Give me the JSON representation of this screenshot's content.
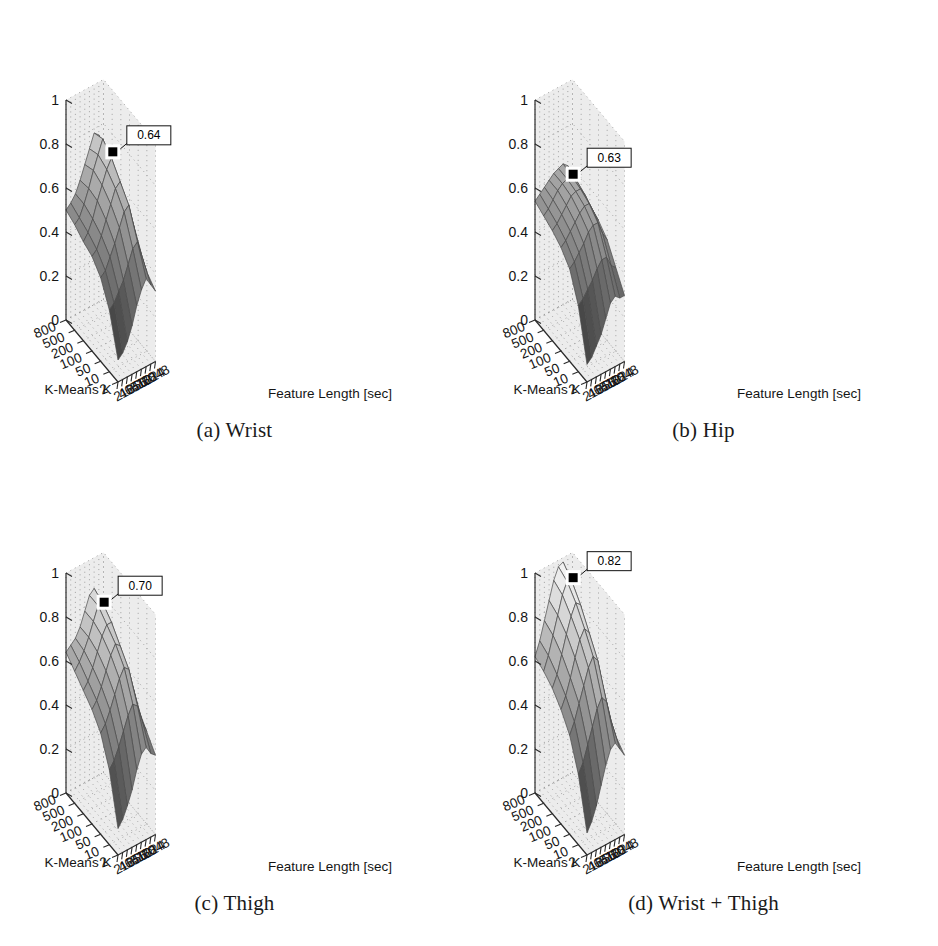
{
  "figure": {
    "background_color": "#ffffff",
    "panel_count": 4,
    "layout": "2x2"
  },
  "axes": {
    "z_ticks": [
      "0",
      "0.2",
      "0.4",
      "0.6",
      "0.8",
      "1"
    ],
    "z_values": [
      0,
      0.2,
      0.4,
      0.6,
      0.8,
      1
    ],
    "x_name": "K-Means K",
    "x_ticks": [
      "800",
      "500",
      "200",
      "100",
      "50",
      "10",
      "2"
    ],
    "x_values": [
      800,
      500,
      200,
      100,
      50,
      10,
      2
    ],
    "y_name": "Feature Length [sec]",
    "y_ticks": [
      "2",
      "4",
      "16",
      "64",
      "256",
      "512",
      "768",
      "1024",
      "2048"
    ],
    "y_values": [
      2,
      4,
      16,
      64,
      256,
      512,
      768,
      1024,
      2048
    ]
  },
  "colors": {
    "wall": "#ececec",
    "grid_dot": "#9a9a9a",
    "axis_line": "#2a2a2a",
    "mesh_edge": "#4a4a4a",
    "marker": "#000000",
    "label_box": "#ffffff",
    "text": "#151515"
  },
  "panels": [
    {
      "id": "a",
      "caption": "(a) Wrist",
      "peak_label": "0.64",
      "peak_value": 0.64
    },
    {
      "id": "b",
      "caption": "(b) Hip",
      "peak_label": "0.63",
      "peak_value": 0.63
    },
    {
      "id": "c",
      "caption": "(c) Thigh",
      "peak_label": "0.70",
      "peak_value": 0.7
    },
    {
      "id": "d",
      "caption": "(d) Wrist + Thigh",
      "peak_label": "0.82",
      "peak_value": 0.82
    }
  ],
  "chart_data": [
    {
      "type": "heatmap",
      "title": "(a) Wrist",
      "render": "3d-surface",
      "xlabel": "K-Means K",
      "ylabel": "Feature Length [sec]",
      "zlabel": "",
      "x": [
        800,
        500,
        200,
        100,
        50,
        10,
        2
      ],
      "y": [
        2,
        4,
        16,
        64,
        256,
        512,
        768,
        1024,
        2048
      ],
      "zlim": [
        0,
        1
      ],
      "grid": true,
      "legend": "none",
      "annotations": [
        {
          "text": "0.64",
          "value": 0.64,
          "marker": "black-square"
        }
      ],
      "values": [
        [
          0.5,
          0.52,
          0.55,
          0.6,
          0.66,
          0.72,
          0.78,
          0.76,
          0.6
        ],
        [
          0.48,
          0.5,
          0.55,
          0.61,
          0.68,
          0.74,
          0.8,
          0.72,
          0.55
        ],
        [
          0.45,
          0.48,
          0.53,
          0.6,
          0.66,
          0.72,
          0.76,
          0.66,
          0.5
        ],
        [
          0.43,
          0.45,
          0.5,
          0.56,
          0.62,
          0.68,
          0.7,
          0.6,
          0.46
        ],
        [
          0.38,
          0.4,
          0.45,
          0.5,
          0.56,
          0.62,
          0.64,
          0.54,
          0.42
        ],
        [
          0.28,
          0.3,
          0.34,
          0.38,
          0.44,
          0.5,
          0.52,
          0.44,
          0.36
        ],
        [
          0.1,
          0.12,
          0.16,
          0.22,
          0.3,
          0.36,
          0.4,
          0.36,
          0.32
        ]
      ]
    },
    {
      "type": "heatmap",
      "title": "(b) Hip",
      "render": "3d-surface",
      "xlabel": "K-Means K",
      "ylabel": "Feature Length [sec]",
      "zlabel": "",
      "x": [
        800,
        500,
        200,
        100,
        50,
        10,
        2
      ],
      "y": [
        2,
        4,
        16,
        64,
        256,
        512,
        768,
        1024,
        2048
      ],
      "zlim": [
        0,
        1
      ],
      "grid": true,
      "legend": "none",
      "annotations": [
        {
          "text": "0.63",
          "value": 0.63,
          "marker": "black-square"
        }
      ],
      "values": [
        [
          0.54,
          0.56,
          0.58,
          0.6,
          0.62,
          0.63,
          0.64,
          0.62,
          0.56
        ],
        [
          0.52,
          0.54,
          0.57,
          0.6,
          0.62,
          0.63,
          0.63,
          0.6,
          0.54
        ],
        [
          0.5,
          0.52,
          0.55,
          0.58,
          0.61,
          0.62,
          0.62,
          0.58,
          0.52
        ],
        [
          0.47,
          0.49,
          0.52,
          0.55,
          0.58,
          0.6,
          0.6,
          0.55,
          0.5
        ],
        [
          0.42,
          0.44,
          0.47,
          0.5,
          0.54,
          0.56,
          0.56,
          0.5,
          0.46
        ],
        [
          0.3,
          0.32,
          0.35,
          0.38,
          0.42,
          0.45,
          0.45,
          0.4,
          0.38
        ],
        [
          0.08,
          0.1,
          0.14,
          0.18,
          0.24,
          0.3,
          0.32,
          0.3,
          0.3
        ]
      ]
    },
    {
      "type": "heatmap",
      "title": "(c) Thigh",
      "render": "3d-surface",
      "xlabel": "K-Means K",
      "ylabel": "Feature Length [sec]",
      "zlabel": "",
      "x": [
        800,
        500,
        200,
        100,
        50,
        10,
        2
      ],
      "y": [
        2,
        4,
        16,
        64,
        256,
        512,
        768,
        1024,
        2048
      ],
      "zlim": [
        0,
        1
      ],
      "grid": true,
      "legend": "none",
      "annotations": [
        {
          "text": "0.70",
          "value": 0.7,
          "marker": "black-square"
        }
      ],
      "values": [
        [
          0.64,
          0.66,
          0.68,
          0.72,
          0.78,
          0.84,
          0.86,
          0.8,
          0.64
        ],
        [
          0.6,
          0.63,
          0.67,
          0.72,
          0.78,
          0.84,
          0.84,
          0.76,
          0.6
        ],
        [
          0.56,
          0.59,
          0.64,
          0.7,
          0.76,
          0.8,
          0.8,
          0.7,
          0.56
        ],
        [
          0.52,
          0.55,
          0.6,
          0.66,
          0.72,
          0.76,
          0.74,
          0.64,
          0.52
        ],
        [
          0.46,
          0.49,
          0.54,
          0.6,
          0.66,
          0.7,
          0.68,
          0.58,
          0.48
        ],
        [
          0.34,
          0.37,
          0.42,
          0.48,
          0.54,
          0.58,
          0.56,
          0.48,
          0.42
        ],
        [
          0.12,
          0.15,
          0.2,
          0.26,
          0.34,
          0.4,
          0.42,
          0.38,
          0.36
        ]
      ]
    },
    {
      "type": "heatmap",
      "title": "(d) Wrist + Thigh",
      "render": "3d-surface",
      "xlabel": "K-Means K",
      "ylabel": "Feature Length [sec]",
      "zlabel": "",
      "x": [
        800,
        500,
        200,
        100,
        50,
        10,
        2
      ],
      "y": [
        2,
        4,
        16,
        64,
        256,
        512,
        768,
        1024,
        2048
      ],
      "zlim": [
        0,
        1
      ],
      "grid": true,
      "legend": "none",
      "annotations": [
        {
          "text": "0.82",
          "value": 0.82,
          "marker": "black-square"
        }
      ],
      "values": [
        [
          0.62,
          0.68,
          0.76,
          0.84,
          0.92,
          0.97,
          0.98,
          0.9,
          0.7
        ],
        [
          0.6,
          0.66,
          0.74,
          0.82,
          0.9,
          0.95,
          0.94,
          0.84,
          0.64
        ],
        [
          0.57,
          0.62,
          0.7,
          0.78,
          0.85,
          0.9,
          0.88,
          0.76,
          0.58
        ],
        [
          0.52,
          0.57,
          0.64,
          0.72,
          0.79,
          0.83,
          0.8,
          0.68,
          0.52
        ],
        [
          0.45,
          0.5,
          0.57,
          0.64,
          0.71,
          0.75,
          0.72,
          0.6,
          0.46
        ],
        [
          0.32,
          0.36,
          0.43,
          0.5,
          0.57,
          0.61,
          0.58,
          0.48,
          0.4
        ],
        [
          0.1,
          0.14,
          0.2,
          0.28,
          0.36,
          0.42,
          0.44,
          0.4,
          0.36
        ]
      ]
    }
  ]
}
